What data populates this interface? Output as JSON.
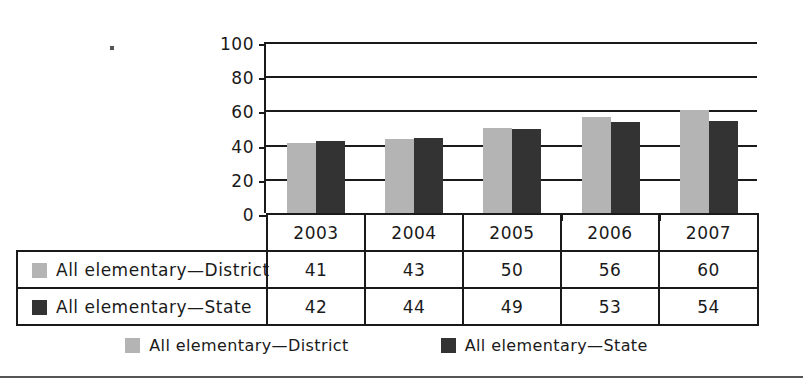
{
  "chart_data": {
    "type": "bar",
    "title": "",
    "xlabel": "",
    "ylabel": "",
    "ylim": [
      0,
      100
    ],
    "yticks": [
      0,
      20,
      40,
      60,
      80,
      100
    ],
    "grid": true,
    "legend_position": "bottom",
    "categories": [
      "2003",
      "2004",
      "2005",
      "2006",
      "2007"
    ],
    "series": [
      {
        "name": "All elementary—District",
        "color": "#b4b4b4",
        "values": [
          41,
          43,
          50,
          56,
          60
        ]
      },
      {
        "name": "All elementary—State",
        "color": "#333333",
        "values": [
          42,
          44,
          49,
          53,
          54
        ]
      }
    ]
  },
  "table": {
    "corner_label": "",
    "column_headers": [
      "2003",
      "2004",
      "2005",
      "2006",
      "2007"
    ],
    "rows": [
      {
        "label": "All elementary—District",
        "swatch": "district",
        "values": [
          "41",
          "43",
          "50",
          "56",
          "60"
        ]
      },
      {
        "label": "All elementary—State",
        "swatch": "state",
        "values": [
          "42",
          "44",
          "49",
          "53",
          "54"
        ]
      }
    ]
  },
  "legend": {
    "items": [
      {
        "label": "All elementary—District",
        "color": "#b4b4b4"
      },
      {
        "label": "All elementary—State",
        "color": "#333333"
      }
    ]
  },
  "axis": {
    "ytick_labels": [
      "100",
      "80",
      "60",
      "40",
      "20",
      "0"
    ]
  }
}
